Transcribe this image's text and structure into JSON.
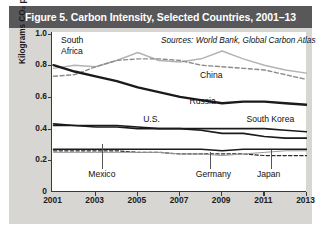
{
  "figure": {
    "title": "Figure 5. Carbon Intensity, Selected Countries, 2001–13",
    "sources": "Sources: World Bank, Global Carbon Atlas"
  },
  "colors": {
    "titlebar": "#58585a",
    "figure_bg": "#d8d6d2",
    "plot_bg": "#ffffff",
    "axis": "#3a3a3a",
    "dark_line": "#1a1a1a",
    "mid_line": "#4d4d4d",
    "light_line": "#b3b3b3"
  },
  "chart_data": {
    "type": "line",
    "title": "Figure 5. Carbon Intensity, Selected Countries, 2001–13",
    "xlabel": "",
    "ylabel": "Kilograms CO₂ per 2011 PPP Dollars",
    "xlim": [
      2001,
      2013
    ],
    "ylim": [
      0,
      1.0
    ],
    "yticks": [
      "0",
      "0.2",
      "0.4",
      "0.6",
      "0.8",
      "1.0"
    ],
    "ytick_values": [
      0,
      0.2,
      0.4,
      0.6,
      0.8,
      1.0
    ],
    "xticks": [
      "2001",
      "2003",
      "2005",
      "2007",
      "2009",
      "2011",
      "2013"
    ],
    "xtick_values": [
      2001,
      2003,
      2005,
      2007,
      2009,
      2011,
      2013
    ],
    "grid": false,
    "legend": "inline-annotations",
    "x": [
      2001,
      2002,
      2003,
      2004,
      2005,
      2006,
      2007,
      2008,
      2009,
      2010,
      2011,
      2012,
      2013
    ],
    "series": [
      {
        "name": "South Africa",
        "style": "solid-light",
        "values": [
          0.78,
          0.8,
          0.79,
          0.83,
          0.88,
          0.83,
          0.82,
          0.84,
          0.89,
          0.84,
          0.8,
          0.77,
          0.75
        ]
      },
      {
        "name": "China",
        "style": "dashed",
        "values": [
          0.73,
          0.74,
          0.79,
          0.83,
          0.84,
          0.84,
          0.83,
          0.8,
          0.79,
          0.78,
          0.77,
          0.74,
          0.71
        ]
      },
      {
        "name": "Russia",
        "style": "solid-dark-thick",
        "values": [
          0.8,
          0.76,
          0.73,
          0.7,
          0.66,
          0.63,
          0.6,
          0.58,
          0.56,
          0.57,
          0.57,
          0.56,
          0.55
        ]
      },
      {
        "name": "U.S.",
        "style": "solid-dark",
        "values": [
          0.43,
          0.42,
          0.42,
          0.42,
          0.41,
          0.4,
          0.4,
          0.39,
          0.37,
          0.37,
          0.35,
          0.34,
          0.34
        ]
      },
      {
        "name": "South Korea",
        "style": "solid-dark",
        "values": [
          0.42,
          0.42,
          0.41,
          0.41,
          0.4,
          0.4,
          0.4,
          0.4,
          0.4,
          0.4,
          0.4,
          0.39,
          0.38
        ]
      },
      {
        "name": "Mexico",
        "style": "solid-dark",
        "values": [
          0.27,
          0.27,
          0.27,
          0.27,
          0.27,
          0.27,
          0.27,
          0.27,
          0.26,
          0.27,
          0.27,
          0.27,
          0.27
        ]
      },
      {
        "name": "Germany",
        "style": "dashed-dark",
        "values": [
          0.26,
          0.26,
          0.26,
          0.26,
          0.25,
          0.25,
          0.24,
          0.24,
          0.24,
          0.24,
          0.23,
          0.23,
          0.23
        ]
      },
      {
        "name": "Japan",
        "style": "solid-light-thin",
        "values": [
          0.25,
          0.25,
          0.25,
          0.25,
          0.25,
          0.25,
          0.24,
          0.24,
          0.23,
          0.24,
          0.25,
          0.26,
          0.26
        ]
      }
    ],
    "annotations": [
      {
        "text": "South",
        "x": 2001.4,
        "y": 0.955
      },
      {
        "text": "Africa",
        "x": 2001.4,
        "y": 0.885
      },
      {
        "text": "China",
        "x": 2008.0,
        "y": 0.735
      },
      {
        "text": "Russia",
        "x": 2007.5,
        "y": 0.565
      },
      {
        "text": "U.S.",
        "x": 2005.3,
        "y": 0.455
      },
      {
        "text": "South Korea",
        "x": 2010.2,
        "y": 0.455
      },
      {
        "text": "Mexico",
        "x": 2002.6,
        "y": 0.11
      },
      {
        "text": "Germany",
        "x": 2007.7,
        "y": 0.11
      },
      {
        "text": "Japan",
        "x": 2010.6,
        "y": 0.11
      }
    ]
  }
}
